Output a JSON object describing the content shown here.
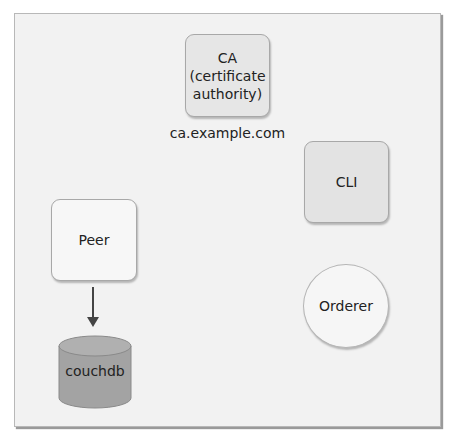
{
  "diagram": {
    "nodes": {
      "ca": {
        "line1": "CA",
        "line2": "(certificate",
        "line3": "authority)",
        "shape": "rounded-rect"
      },
      "ca_host": "ca.example.com",
      "cli": {
        "label": "CLI",
        "shape": "rounded-rect"
      },
      "peer": {
        "label": "Peer",
        "shape": "rounded-rect"
      },
      "orderer": {
        "label": "Orderer",
        "shape": "circle"
      },
      "couchdb": {
        "label": "couchdb",
        "shape": "cylinder"
      }
    },
    "edges": [
      {
        "from": "Peer",
        "to": "couchdb",
        "type": "arrow"
      }
    ],
    "colors": {
      "background": "#f2f2f2",
      "box_border": "#a8a8a8",
      "database_fill": "#a3a3a3",
      "arrow": "#444444"
    }
  }
}
